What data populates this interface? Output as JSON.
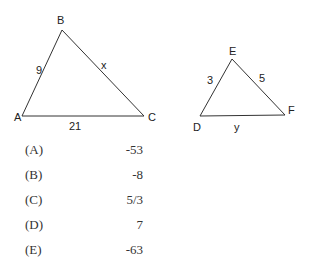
{
  "triangle_abc": {
    "vertices": {
      "A": "A",
      "B": "B",
      "C": "C"
    },
    "sides": {
      "AB": "9",
      "BC": "x",
      "AC": "21"
    }
  },
  "triangle_def": {
    "vertices": {
      "D": "D",
      "E": "E",
      "F": "F"
    },
    "sides": {
      "DE": "3",
      "EF": "5",
      "DF": "y"
    }
  },
  "choices": [
    {
      "letter": "(A)",
      "value": "-53"
    },
    {
      "letter": "(B)",
      "value": "-8"
    },
    {
      "letter": "(C)",
      "value": "5/3"
    },
    {
      "letter": "(D)",
      "value": "7"
    },
    {
      "letter": "(E)",
      "value": "-63"
    }
  ]
}
